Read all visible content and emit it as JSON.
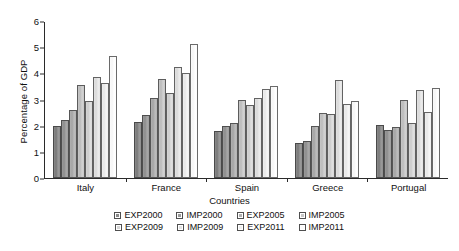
{
  "chart_data": {
    "type": "bar",
    "title": "",
    "xlabel": "Countries",
    "ylabel": "Percentage of GDP",
    "ylim": [
      0,
      6
    ],
    "yticks": [
      0,
      1,
      2,
      3,
      4,
      5,
      6
    ],
    "grid": false,
    "legend_position": "bottom",
    "categories": [
      "Italy",
      "France",
      "Spain",
      "Greece",
      "Portugal"
    ],
    "series": [
      {
        "name": "EXP2000",
        "values": [
          2.0,
          2.15,
          1.8,
          1.35,
          2.02
        ]
      },
      {
        "name": "IMP2000",
        "values": [
          2.23,
          2.4,
          1.98,
          1.4,
          1.85
        ]
      },
      {
        "name": "EXP2005",
        "values": [
          2.6,
          3.05,
          2.12,
          2.0,
          1.96
        ]
      },
      {
        "name": "IMP2005",
        "values": [
          3.57,
          3.8,
          2.98,
          2.5,
          3.0
        ]
      },
      {
        "name": "EXP2009",
        "values": [
          2.93,
          3.23,
          2.78,
          2.46,
          2.1
        ]
      },
      {
        "name": "IMP2009",
        "values": [
          3.85,
          4.25,
          3.05,
          3.73,
          3.35
        ]
      },
      {
        "name": "EXP2011",
        "values": [
          3.65,
          4.03,
          3.4,
          2.82,
          2.52
        ]
      },
      {
        "name": "IMP2011",
        "values": [
          4.65,
          5.13,
          3.5,
          2.95,
          3.43
        ]
      }
    ]
  },
  "legend": {
    "row1": [
      "EXP2000",
      "IMP2000",
      "EXP2005",
      "IMP2005"
    ],
    "row2": [
      "EXP2009",
      "IMP2009",
      "EXP2011",
      "IMP2011"
    ]
  }
}
